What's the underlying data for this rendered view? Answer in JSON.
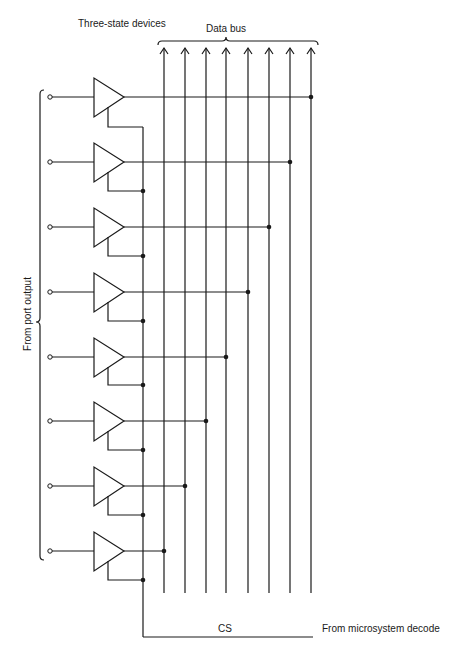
{
  "labels": {
    "three_state_devices": "Three-state devices",
    "data_bus": "Data bus",
    "from_port_output": "From port output",
    "cs": "CS",
    "from_microsystem_decode": "From microsystem decode"
  },
  "diagram": {
    "stroke_color": "#1a1a1a",
    "bus_lines_x": [
      164,
      185,
      206,
      226,
      248,
      269,
      290,
      311
    ],
    "bus_top_y": 48,
    "bus_bottom_y": 593,
    "cs_line_x": 143,
    "cs_bottom_y": 637,
    "cs_end_x": 313,
    "buffers": [
      {
        "row": 1,
        "y": 97,
        "bus_junction_x": 311,
        "enable_y": 127
      },
      {
        "row": 2,
        "y": 162,
        "bus_junction_x": 290,
        "enable_y": 191
      },
      {
        "row": 3,
        "y": 227,
        "bus_junction_x": 269,
        "enable_y": 256
      },
      {
        "row": 4,
        "y": 292,
        "bus_junction_x": 248,
        "enable_y": 321
      },
      {
        "row": 5,
        "y": 357,
        "bus_junction_x": 226,
        "enable_y": 385
      },
      {
        "row": 6,
        "y": 421,
        "bus_junction_x": 206,
        "enable_y": 450
      },
      {
        "row": 7,
        "y": 486,
        "bus_junction_x": 185,
        "enable_y": 515
      },
      {
        "row": 8,
        "y": 551,
        "bus_junction_x": 164,
        "enable_y": 580
      }
    ]
  }
}
